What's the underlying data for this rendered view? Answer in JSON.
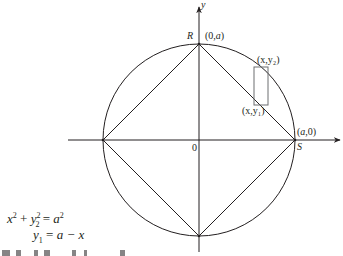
{
  "diagram": {
    "colors": {
      "ink": "#231f20",
      "rect": "#6d6e70"
    },
    "circle": {
      "cx": 199,
      "cy": 140,
      "r": 96
    },
    "axes": {
      "x": {
        "from": [
          68,
          140
        ],
        "to": [
          341,
          140
        ],
        "label": ""
      },
      "y": {
        "from": [
          199,
          252
        ],
        "to": [
          199,
          5
        ],
        "label": "y"
      }
    },
    "square_vertices": {
      "top": [
        199,
        44
      ],
      "right": [
        295,
        140
      ],
      "bottom": [
        199,
        236
      ],
      "left": [
        103,
        140
      ]
    },
    "strip_rect": {
      "x": 254,
      "y": 67,
      "w": 14,
      "h": 38
    },
    "labels": {
      "y_axis": "y",
      "R": "R",
      "top_point": "(0,a)",
      "S": "S",
      "right_point": "(a,0)",
      "origin": "0",
      "upper_point": "(x,y₂)",
      "lower_point": "(x,y₁)"
    },
    "equations": {
      "circle_eq": {
        "lhs_x": "x",
        "exp1": "2",
        "plus": " + ",
        "lhs_y": "y",
        "sub": "2",
        "exp2": "2",
        "eq": " = ",
        "rhs": "a",
        "exp3": "2"
      },
      "line_eq": {
        "y": "y",
        "sub": "1",
        "eq": " = ",
        "rhs": "a − x"
      }
    }
  }
}
